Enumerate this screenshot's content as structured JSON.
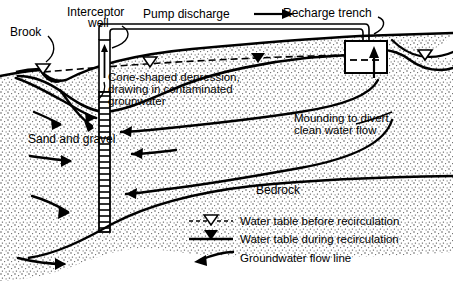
{
  "figure": {
    "type": "cross-section-diagram"
  },
  "labels": {
    "brook": "Brook",
    "interceptor_well_line1": "Interceptor",
    "interceptor_well_line2": "well",
    "pump_discharge": "Pump discharge",
    "recharge_trench": "Recharge trench",
    "cone_line1": "Cone-shaped depression,",
    "cone_line2": "drawing in contaminated",
    "cone_line3": "grounwater",
    "mounding_line1": "Mounding to divert",
    "mounding_line2": "clean water flow",
    "sand_and_gravel": "Sand and gravel",
    "bedrock": "Bedrock"
  },
  "legend": {
    "items": [
      {
        "symbol": "dashed-line-hollow-triangle",
        "label": "Water table before recirculation"
      },
      {
        "symbol": "solid-line-filled-triangle",
        "label": "Water table during recirculation"
      },
      {
        "symbol": "curved-arrow",
        "label": "Groundwater flow line"
      }
    ]
  },
  "colors": {
    "ink": "#000000",
    "background": "#ffffff",
    "stipple": "#4a4a4a"
  }
}
